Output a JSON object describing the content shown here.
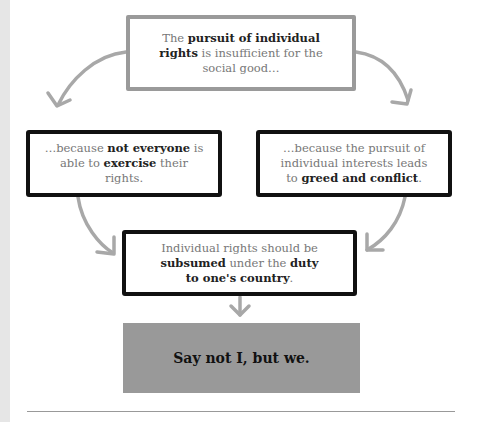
{
  "diagram": {
    "top": {
      "segments": [
        {
          "text": "The ",
          "bold": false
        },
        {
          "text": "pursuit of individual rights",
          "bold": true
        },
        {
          "text": " is insufficient for the social good…",
          "bold": false
        }
      ]
    },
    "left": {
      "segments": [
        {
          "text": "…because ",
          "bold": false
        },
        {
          "text": "not everyone",
          "bold": true
        },
        {
          "text": " is able to ",
          "bold": false
        },
        {
          "text": "exercise",
          "bold": true
        },
        {
          "text": " their rights.",
          "bold": false
        }
      ]
    },
    "right": {
      "segments": [
        {
          "text": "…because the pursuit of individual interests leads to ",
          "bold": false
        },
        {
          "text": "greed and conflict",
          "bold": true
        },
        {
          "text": ".",
          "bold": false
        }
      ]
    },
    "center": {
      "segments": [
        {
          "text": "Individual rights should be ",
          "bold": false
        },
        {
          "text": "subsumed",
          "bold": true
        },
        {
          "text": " under the ",
          "bold": false
        },
        {
          "text": "duty to one's country",
          "bold": true
        },
        {
          "text": ".",
          "bold": false
        }
      ]
    },
    "conclusion": "Say not I, but we.",
    "colors": {
      "arrow": "#a8a8a8",
      "top_border": "#9a9a9a",
      "box_border": "#111111",
      "conclusion_bg": "#999999",
      "stripe": "#e6e6e6"
    }
  }
}
